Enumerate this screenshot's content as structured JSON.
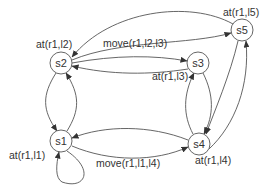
{
  "diagram": {
    "type": "state-transition-graph",
    "nodes": [
      {
        "id": "s1",
        "label": "s1",
        "state_label": "at(r1,l1)"
      },
      {
        "id": "s2",
        "label": "s2",
        "state_label": "at(r1,l2)"
      },
      {
        "id": "s3",
        "label": "s3",
        "state_label": "at(r1,l3)"
      },
      {
        "id": "s4",
        "label": "s4",
        "state_label": "at(r1,l4)"
      },
      {
        "id": "s5",
        "label": "s5",
        "state_label": "at(r1,l5)"
      }
    ],
    "edge_labels": {
      "s2_s3": "move(r1,l2,l3)",
      "s1_s4": "move(r1,l1,l4)"
    },
    "edges": [
      {
        "from": "s5",
        "to": "s2"
      },
      {
        "from": "s2",
        "to": "s5"
      },
      {
        "from": "s2",
        "to": "s3",
        "label": "move(r1,l2,l3)"
      },
      {
        "from": "s3",
        "to": "s2"
      },
      {
        "from": "s2",
        "to": "s1"
      },
      {
        "from": "s1",
        "to": "s2"
      },
      {
        "from": "s1",
        "to": "s1"
      },
      {
        "from": "s4",
        "to": "s1"
      },
      {
        "from": "s1",
        "to": "s4",
        "label": "move(r1,l1,l4)"
      },
      {
        "from": "s3",
        "to": "s4"
      },
      {
        "from": "s4",
        "to": "s3"
      },
      {
        "from": "s5",
        "to": "s4"
      },
      {
        "from": "s4",
        "to": "s5"
      }
    ]
  }
}
